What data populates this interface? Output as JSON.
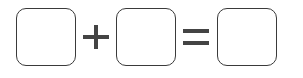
{
  "equation": {
    "operands": [
      {
        "name": "first-blank",
        "value": ""
      },
      {
        "name": "second-blank",
        "value": ""
      },
      {
        "name": "result-blank",
        "value": ""
      }
    ],
    "operator": "plus-icon",
    "relation": "equals-icon",
    "colors": {
      "stroke": "#3a3a3a",
      "symbol": "#444444",
      "background": "#ffffff"
    }
  }
}
